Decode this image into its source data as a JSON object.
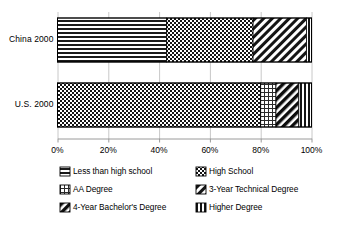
{
  "chart_data": {
    "type": "bar",
    "orientation": "horizontal",
    "stacked": true,
    "normalized_percent": true,
    "title": "",
    "xlabel": "",
    "ylabel": "",
    "xlim": [
      0,
      100
    ],
    "grid": true,
    "grid_axis": "x",
    "legend_position": "bottom",
    "categories": [
      "China 2000",
      "U.S. 2000"
    ],
    "tick_labels": [
      "0%",
      "20%",
      "40%",
      "60%",
      "80%",
      "100%"
    ],
    "tick_values": [
      0,
      20,
      40,
      60,
      80,
      100
    ],
    "series": [
      {
        "name": "Less than high school",
        "pattern": "horizontal-lines",
        "values": [
          43,
          0
        ]
      },
      {
        "name": "High School",
        "pattern": "checkerboard",
        "values": [
          34,
          80
        ]
      },
      {
        "name": "AA Degree",
        "pattern": "grid",
        "values": [
          0,
          6
        ]
      },
      {
        "name": "3-Year Technical Degree",
        "pattern": "diagonal-stripes",
        "values": [
          21,
          0
        ]
      },
      {
        "name": "4-Year Bachelor's Degree",
        "pattern": "dark-diagonal",
        "values": [
          0,
          9
        ]
      },
      {
        "name": "Higher Degree",
        "pattern": "vertical-lines",
        "values": [
          2,
          5
        ]
      }
    ]
  },
  "axis": {
    "ticks": [
      {
        "label": "0%",
        "value": 0
      },
      {
        "label": "20%",
        "value": 20
      },
      {
        "label": "40%",
        "value": 40
      },
      {
        "label": "60%",
        "value": 60
      },
      {
        "label": "80%",
        "value": 80
      },
      {
        "label": "100%",
        "value": 100
      }
    ]
  },
  "categories": [
    {
      "label": "China 2000"
    },
    {
      "label": "U.S. 2000"
    }
  ],
  "legend": {
    "items": [
      {
        "label": "Less than high school",
        "pattern": "horizontal-lines"
      },
      {
        "label": "High School",
        "pattern": "checkerboard"
      },
      {
        "label": "AA Degree",
        "pattern": "grid"
      },
      {
        "label": "3-Year Technical Degree",
        "pattern": "diagonal-stripes"
      },
      {
        "label": "4-Year Bachelor's Degree",
        "pattern": "dark-diagonal"
      },
      {
        "label": "Higher Degree",
        "pattern": "vertical-lines"
      }
    ]
  },
  "colors": {
    "ink": "#000000",
    "grid": "#c8c8c8",
    "axis": "#9a9a9a",
    "background": "#ffffff"
  }
}
